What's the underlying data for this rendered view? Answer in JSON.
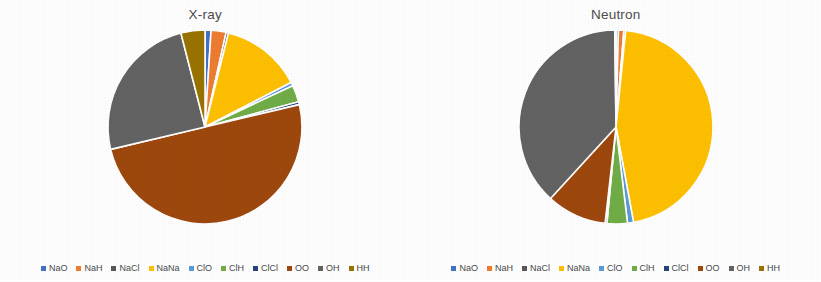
{
  "figure": {
    "background_color": "#ffffff",
    "panels": [
      {
        "title": "X-ray"
      },
      {
        "title": "Neutron"
      }
    ]
  },
  "legend": {
    "items": [
      {
        "label": "NaO",
        "color": "#4472c4"
      },
      {
        "label": "NaH",
        "color": "#ed7d31"
      },
      {
        "label": "NaCl",
        "color": "#595959"
      },
      {
        "label": "NaNa",
        "color": "#ffc000"
      },
      {
        "label": "ClO",
        "color": "#5b9bd5"
      },
      {
        "label": "ClH",
        "color": "#70ad47"
      },
      {
        "label": "ClCl",
        "color": "#264478"
      },
      {
        "label": "OO",
        "color": "#9e480e"
      },
      {
        "label": "OH",
        "color": "#636363"
      },
      {
        "label": "HH",
        "color": "#997300"
      }
    ]
  },
  "chart_data": [
    {
      "type": "pie",
      "title": "X-ray",
      "labels": [
        "NaO",
        "NaH",
        "NaCl",
        "NaNa",
        "ClO",
        "ClH",
        "ClCl",
        "OO",
        "OH",
        "HH"
      ],
      "values": [
        1.0,
        2.5,
        0.4,
        13.5,
        0.6,
        2.8,
        0.5,
        50.0,
        24.7,
        4.0
      ],
      "colors": [
        "#4472c4",
        "#ed7d31",
        "#595959",
        "#ffc000",
        "#5b9bd5",
        "#70ad47",
        "#264478",
        "#9e480e",
        "#636363",
        "#997300"
      ],
      "start_angle": 0,
      "direction": "clockwise",
      "legend_position": "bottom",
      "grid": false,
      "labels_shown": false
    },
    {
      "type": "pie",
      "title": "Neutron",
      "labels": [
        "NaO",
        "NaH",
        "NaCl",
        "NaNa",
        "ClO",
        "ClH",
        "ClCl",
        "OO",
        "OH",
        "HH"
      ],
      "values": [
        0.4,
        0.9,
        0.3,
        45.5,
        1.0,
        3.4,
        0.3,
        10.0,
        38.0,
        0.2
      ],
      "colors": [
        "#4472c4",
        "#ed7d31",
        "#595959",
        "#ffc000",
        "#5b9bd5",
        "#70ad47",
        "#264478",
        "#9e480e",
        "#636363",
        "#997300"
      ],
      "start_angle": 0,
      "direction": "clockwise",
      "legend_position": "bottom",
      "grid": false,
      "labels_shown": false
    }
  ]
}
